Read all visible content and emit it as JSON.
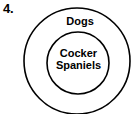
{
  "figure": {
    "item_number": "4.",
    "type": "nested-set-diagram",
    "background_color": "#ffffff",
    "stroke_color": "#000000",
    "text_color": "#000000"
  },
  "outer_set": {
    "label": "Dogs",
    "cx": 77,
    "cy": 61,
    "r": 53
  },
  "inner_set": {
    "label_line1": "Cocker",
    "label_line2": "Spaniels",
    "cx": 78,
    "cy": 63,
    "r": 31
  }
}
